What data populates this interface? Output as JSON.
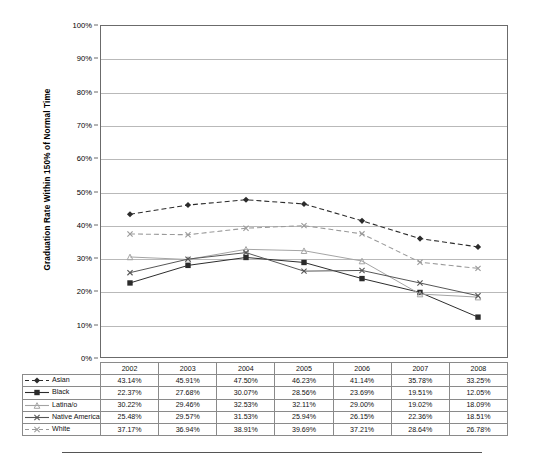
{
  "chart_data": {
    "type": "line",
    "title": "",
    "xlabel": "",
    "ylabel": "Graduation Rate Within 150% of Normal Time",
    "ylim": [
      0,
      100
    ],
    "ytick_labels": [
      "100%",
      "90%",
      "80%",
      "70%",
      "60%",
      "50%",
      "40%",
      "30%",
      "20%",
      "10%",
      "0%"
    ],
    "ytick_values": [
      100,
      90,
      80,
      70,
      60,
      50,
      40,
      30,
      20,
      10,
      0
    ],
    "grid": true,
    "legend_position": "table-left-column",
    "categories": [
      "2002",
      "2003",
      "2004",
      "2005",
      "2006",
      "2007",
      "2008"
    ],
    "series": [
      {
        "name": "Asian",
        "values": [
          43.14,
          45.91,
          47.5,
          46.23,
          41.14,
          35.78,
          33.25
        ],
        "labels": [
          "43.14%",
          "45.91%",
          "47.50%",
          "46.23%",
          "41.14%",
          "35.78%",
          "33.25%"
        ],
        "color": "#2b2b2b",
        "line_style": "dashed",
        "marker": "diamond"
      },
      {
        "name": "Black",
        "values": [
          22.37,
          27.68,
          30.07,
          28.56,
          23.69,
          19.51,
          12.05
        ],
        "labels": [
          "22.37%",
          "27.68%",
          "30.07%",
          "28.56%",
          "23.69%",
          "19.51%",
          "12.05%"
        ],
        "color": "#2b2b2b",
        "line_style": "solid",
        "marker": "square"
      },
      {
        "name": "Latina/o",
        "values": [
          30.22,
          29.46,
          32.53,
          32.11,
          29.0,
          19.02,
          18.09
        ],
        "labels": [
          "30.22%",
          "29.46%",
          "32.53%",
          "32.11%",
          "29.00%",
          "19.02%",
          "18.09%"
        ],
        "color": "#a3a3a3",
        "line_style": "solid",
        "marker": "triangle"
      },
      {
        "name": "Native American",
        "values": [
          25.48,
          29.57,
          31.53,
          25.94,
          26.15,
          22.36,
          18.51
        ],
        "labels": [
          "25.48%",
          "29.57%",
          "31.53%",
          "25.94%",
          "26.15%",
          "22.36%",
          "18.51%"
        ],
        "color": "#555555",
        "line_style": "solid",
        "marker": "x"
      },
      {
        "name": "White",
        "values": [
          37.17,
          36.94,
          38.91,
          39.69,
          37.21,
          28.64,
          26.78
        ],
        "labels": [
          "37.17%",
          "36.94%",
          "38.91%",
          "39.69%",
          "37.21%",
          "28.64%",
          "26.78%"
        ],
        "color": "#9a9a9a",
        "line_style": "dashed",
        "marker": "x"
      }
    ]
  },
  "table": {
    "header_blank": "",
    "year_headers": [
      "2002",
      "2003",
      "2004",
      "2005",
      "2006",
      "2007",
      "2008"
    ],
    "rows": [
      {
        "label": "Asian",
        "cells": [
          "43.14%",
          "45.91%",
          "47.50%",
          "46.23%",
          "41.14%",
          "35.78%",
          "33.25%"
        ]
      },
      {
        "label": "Black",
        "cells": [
          "22.37%",
          "27.68%",
          "30.07%",
          "28.56%",
          "23.69%",
          "19.51%",
          "12.05%"
        ]
      },
      {
        "label": "Latina/o",
        "cells": [
          "30.22%",
          "29.46%",
          "32.53%",
          "32.11%",
          "29.00%",
          "19.02%",
          "18.09%"
        ]
      },
      {
        "label": "Native American",
        "cells": [
          "25.48%",
          "29.57%",
          "31.53%",
          "25.94%",
          "26.15%",
          "22.36%",
          "18.51%"
        ]
      },
      {
        "label": "White",
        "cells": [
          "37.17%",
          "36.94%",
          "38.91%",
          "39.69%",
          "37.21%",
          "28.64%",
          "26.78%"
        ]
      }
    ]
  }
}
